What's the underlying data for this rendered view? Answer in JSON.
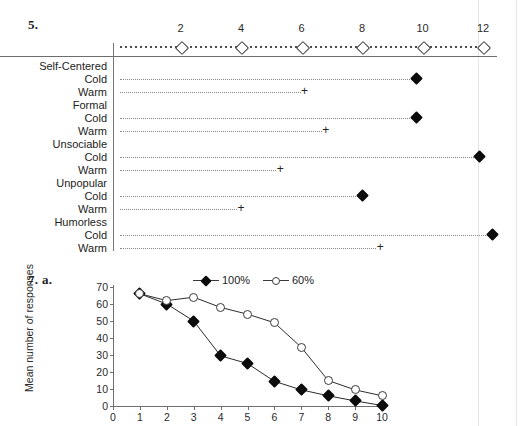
{
  "figure5": {
    "number_label": "5.",
    "axis": {
      "ticks": [
        2,
        4,
        6,
        8,
        10,
        12
      ],
      "min": 0,
      "max": 12.6,
      "marker": "open-diamond",
      "style": "dotted-ruler"
    },
    "legend_markers": {
      "cold": "filled-diamond",
      "warm": "plus"
    },
    "groups": [
      {
        "name": "Self-Centered",
        "rows": [
          {
            "label": "Cold",
            "marker": "filled-diamond",
            "value": 9.8
          },
          {
            "label": "Warm",
            "marker": "plus",
            "value": 6.1
          }
        ]
      },
      {
        "name": "Formal",
        "rows": [
          {
            "label": "Cold",
            "marker": "filled-diamond",
            "value": 9.8
          },
          {
            "label": "Warm",
            "marker": "plus",
            "value": 6.8
          }
        ]
      },
      {
        "name": "Unsociable",
        "rows": [
          {
            "label": "Cold",
            "marker": "filled-diamond",
            "value": 11.9
          },
          {
            "label": "Warm",
            "marker": "plus",
            "value": 5.3
          }
        ]
      },
      {
        "name": "Unpopular",
        "rows": [
          {
            "label": "Cold",
            "marker": "filled-diamond",
            "value": 8.0
          },
          {
            "label": "Warm",
            "marker": "plus",
            "value": 4.0
          }
        ]
      },
      {
        "name": "Humorless",
        "rows": [
          {
            "label": "Cold",
            "marker": "filled-diamond",
            "value": 12.3
          },
          {
            "label": "Warm",
            "marker": "plus",
            "value": 8.6
          }
        ]
      }
    ]
  },
  "figure7": {
    "number_label": "7. a."
  },
  "chart_data": {
    "type": "line",
    "title": "",
    "xlabel": "",
    "ylabel": "Mean number of responses",
    "x": [
      1,
      2,
      3,
      4,
      5,
      6,
      7,
      8,
      9,
      10
    ],
    "xticks": [
      0,
      1,
      2,
      3,
      4,
      5,
      6,
      7,
      8,
      9,
      10
    ],
    "yticks": [
      0,
      10,
      20,
      30,
      40,
      50,
      60,
      70
    ],
    "xlim": [
      0,
      10
    ],
    "ylim": [
      0,
      70
    ],
    "grid": false,
    "legend_position": "top-center",
    "series": [
      {
        "name": "100%",
        "marker": "filled-diamond",
        "values": [
          66,
          60,
          50,
          29.5,
          25,
          14.5,
          9.5,
          6,
          3,
          0.3
        ]
      },
      {
        "name": "60%",
        "marker": "open-circle",
        "values": [
          66,
          62,
          64,
          58,
          54,
          49,
          34.5,
          15,
          9.5,
          6
        ]
      }
    ]
  }
}
